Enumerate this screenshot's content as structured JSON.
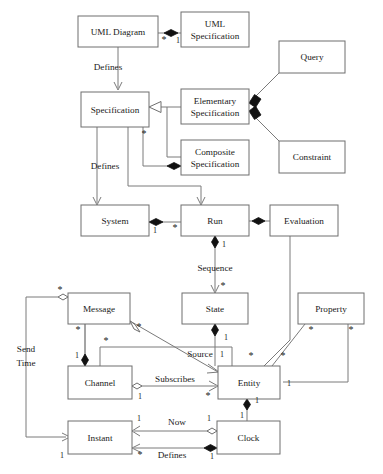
{
  "diagram": {
    "type": "uml-class-diagram",
    "canvas": {
      "width": 383,
      "height": 474,
      "background": "#ffffff"
    },
    "colors": {
      "box_stroke": "#6e6e6e",
      "box_fill": "#ffffff",
      "edge": "#7a7a7a",
      "text": "#1a1a1a",
      "diamond_filled": "#111111"
    },
    "classes": [
      {
        "id": "uml_diagram",
        "label": "UML Diagram",
        "x": 78,
        "y": 16,
        "w": 80,
        "h": 31,
        "lines": [
          "UML Diagram"
        ]
      },
      {
        "id": "uml_specification",
        "label": "UML Specification",
        "x": 181,
        "y": 12,
        "w": 68,
        "h": 35,
        "lines": [
          "UML",
          "Specification"
        ]
      },
      {
        "id": "query",
        "label": "Query",
        "x": 279,
        "y": 41,
        "w": 66,
        "h": 32,
        "lines": [
          "Query"
        ]
      },
      {
        "id": "specification",
        "label": "Specification",
        "x": 81,
        "y": 92,
        "w": 68,
        "h": 35,
        "lines": [
          "Specification"
        ]
      },
      {
        "id": "elementary_specification",
        "label": "Elementary Specification",
        "x": 181,
        "y": 89,
        "w": 68,
        "h": 35,
        "lines": [
          "Elementary",
          "Specification"
        ]
      },
      {
        "id": "constraint",
        "label": "Constraint",
        "x": 279,
        "y": 141,
        "w": 66,
        "h": 32,
        "lines": [
          "Constraint"
        ]
      },
      {
        "id": "composite_specification",
        "label": "Composite Specification",
        "x": 181,
        "y": 140,
        "w": 68,
        "h": 35,
        "lines": [
          "Composite",
          "Specification"
        ]
      },
      {
        "id": "system",
        "label": "System",
        "x": 81,
        "y": 205,
        "w": 68,
        "h": 31,
        "lines": [
          "System"
        ]
      },
      {
        "id": "run",
        "label": "Run",
        "x": 181,
        "y": 205,
        "w": 68,
        "h": 31,
        "lines": [
          "Run"
        ]
      },
      {
        "id": "evaluation",
        "label": "Evaluation",
        "x": 270,
        "y": 205,
        "w": 68,
        "h": 31,
        "lines": [
          "Evaluation"
        ]
      },
      {
        "id": "message",
        "label": "Message",
        "x": 68,
        "y": 293,
        "w": 62,
        "h": 31,
        "lines": [
          "Message"
        ]
      },
      {
        "id": "state",
        "label": "State",
        "x": 182,
        "y": 293,
        "w": 66,
        "h": 31,
        "lines": [
          "State"
        ]
      },
      {
        "id": "property",
        "label": "Property",
        "x": 298,
        "y": 293,
        "w": 66,
        "h": 31,
        "lines": [
          "Property"
        ]
      },
      {
        "id": "channel",
        "label": "Channel",
        "x": 68,
        "y": 366,
        "w": 64,
        "h": 33,
        "lines": [
          "Channel"
        ]
      },
      {
        "id": "entity",
        "label": "Entity",
        "x": 218,
        "y": 366,
        "w": 62,
        "h": 33,
        "lines": [
          "Entity"
        ]
      },
      {
        "id": "instant",
        "label": "Instant",
        "x": 68,
        "y": 421,
        "w": 64,
        "h": 33,
        "lines": [
          "Instant"
        ]
      },
      {
        "id": "clock",
        "label": "Clock",
        "x": 217,
        "y": 421,
        "w": 63,
        "h": 33,
        "lines": [
          "Clock"
        ]
      }
    ],
    "relationships": [
      {
        "id": "umldiagram_umlspec",
        "from": "uml_diagram",
        "to": "uml_specification",
        "kind": "composition",
        "source_mult": "*",
        "target_mult": "1"
      },
      {
        "id": "umldiagram_defines_spec",
        "from": "uml_diagram",
        "to": "specification",
        "kind": "directed",
        "label": "Defines"
      },
      {
        "id": "elem_gen_spec",
        "from": "elementary_specification",
        "to": "specification",
        "kind": "generalization"
      },
      {
        "id": "comp_gen_spec",
        "from": "composite_specification",
        "to": "specification",
        "kind": "generalization"
      },
      {
        "id": "comp_contains_spec",
        "from": "composite_specification",
        "to": "specification",
        "kind": "composition",
        "source_mult": "*"
      },
      {
        "id": "query_elem",
        "from": "query",
        "to": "elementary_specification",
        "kind": "composition"
      },
      {
        "id": "constraint_elem",
        "from": "constraint",
        "to": "elementary_specification",
        "kind": "composition"
      },
      {
        "id": "spec_defines_system",
        "from": "specification",
        "to": "system",
        "kind": "directed",
        "label": "Defines"
      },
      {
        "id": "spec_defines_run",
        "from": "specification",
        "to": "run",
        "kind": "directed"
      },
      {
        "id": "system_run",
        "from": "system",
        "to": "run",
        "kind": "composition",
        "source_mult": "1",
        "target_mult": "*"
      },
      {
        "id": "evaluation_run",
        "from": "evaluation",
        "to": "run",
        "kind": "composition"
      },
      {
        "id": "run_sequence_state",
        "from": "run",
        "to": "state",
        "kind": "composition-directed",
        "label": "Sequence",
        "source_mult": "1",
        "target_mult": "*"
      },
      {
        "id": "message_sendtime_instant",
        "from": "message",
        "to": "instant",
        "kind": "aggregation",
        "label": "Send Time",
        "source_mult": "*",
        "target_mult": "1"
      },
      {
        "id": "message_channel",
        "from": "message",
        "to": "channel",
        "kind": "composition",
        "source_mult": "*",
        "target_mult": "1"
      },
      {
        "id": "message_source_entity",
        "from": "message",
        "to": "entity",
        "kind": "aggregation-directed",
        "label": "Source",
        "source_mult": "*",
        "target_mult": "1"
      },
      {
        "id": "state_entity",
        "from": "state",
        "to": "entity",
        "kind": "composition",
        "target_mult": "1"
      },
      {
        "id": "property_entity_left",
        "from": "property",
        "to": "entity",
        "kind": "association",
        "source_mult": "*",
        "target_mult": "*"
      },
      {
        "id": "property_entity_right",
        "from": "property",
        "to": "entity",
        "kind": "composition",
        "source_mult": "*",
        "target_mult": "1"
      },
      {
        "id": "channel_subscribes_entity",
        "from": "channel",
        "to": "entity",
        "kind": "aggregation-directed",
        "label": "Subscribes",
        "source_mult": "1",
        "target_mult": "*"
      },
      {
        "id": "channel_entity_top",
        "from": "channel",
        "to": "entity",
        "kind": "association",
        "source_mult": "*",
        "target_mult": "*"
      },
      {
        "id": "entity_clock",
        "from": "entity",
        "to": "clock",
        "kind": "composition",
        "source_mult": "1",
        "target_mult": "1"
      },
      {
        "id": "clock_now_instant",
        "from": "clock",
        "to": "instant",
        "kind": "aggregation-directed",
        "label": "Now",
        "source_mult": "1",
        "target_mult": "1"
      },
      {
        "id": "clock_defines_instant",
        "from": "clock",
        "to": "instant",
        "kind": "composition-directed",
        "label": "Defines",
        "source_mult": "1",
        "target_mult": "*"
      }
    ],
    "edge_labels": [
      {
        "id": "lbl_defines_top",
        "text": "Defines",
        "x": 108,
        "y": 70
      },
      {
        "id": "lbl_defines_mid",
        "text": "Defines",
        "x": 105,
        "y": 169
      },
      {
        "id": "lbl_sequence",
        "text": "Sequence",
        "x": 215,
        "y": 271
      },
      {
        "id": "lbl_send",
        "text": "Send",
        "x": 26,
        "y": 352
      },
      {
        "id": "lbl_time",
        "text": "Time",
        "x": 26,
        "y": 366
      },
      {
        "id": "lbl_source",
        "text": "Source",
        "x": 200,
        "y": 357
      },
      {
        "id": "lbl_subscribes",
        "text": "Subscribes",
        "x": 175,
        "y": 382
      },
      {
        "id": "lbl_now",
        "text": "Now",
        "x": 177,
        "y": 425
      },
      {
        "id": "lbl_defines_bottom",
        "text": "Defines",
        "x": 172,
        "y": 458
      }
    ],
    "multiplicities": [
      {
        "id": "m_umldiag_star",
        "text": "*",
        "x": 164,
        "y": 43
      },
      {
        "id": "m_umlspec_1",
        "text": "1",
        "x": 178,
        "y": 43
      },
      {
        "id": "m_spec_star",
        "text": "*",
        "x": 144,
        "y": 137
      },
      {
        "id": "m_system_1",
        "text": "1",
        "x": 155,
        "y": 233
      },
      {
        "id": "m_run_star",
        "text": "*",
        "x": 175,
        "y": 231
      },
      {
        "id": "m_run_seq_1",
        "text": "1",
        "x": 224,
        "y": 247
      },
      {
        "id": "m_state_star",
        "text": "*",
        "x": 223,
        "y": 289
      },
      {
        "id": "m_msg_left_star",
        "text": "*",
        "x": 60,
        "y": 293
      },
      {
        "id": "m_msg_bottom_star",
        "text": "*",
        "x": 78,
        "y": 333
      },
      {
        "id": "m_msg_right_star",
        "text": "*",
        "x": 139,
        "y": 330
      },
      {
        "id": "m_channel_1",
        "text": "1",
        "x": 77,
        "y": 358
      },
      {
        "id": "m_state_entity_1",
        "text": "1",
        "x": 226,
        "y": 340
      },
      {
        "id": "m_source_1",
        "text": "1",
        "x": 222,
        "y": 357
      },
      {
        "id": "m_entity_top_star",
        "text": "*",
        "x": 251,
        "y": 359
      },
      {
        "id": "m_prop_left_star",
        "text": "*",
        "x": 283,
        "y": 359
      },
      {
        "id": "m_prop_l_star",
        "text": "*",
        "x": 311,
        "y": 333
      },
      {
        "id": "m_prop_r_star",
        "text": "*",
        "x": 351,
        "y": 333
      },
      {
        "id": "m_channeltop_star",
        "text": "*",
        "x": 106,
        "y": 344
      },
      {
        "id": "m_entity_sub_star",
        "text": "*",
        "x": 208,
        "y": 399
      },
      {
        "id": "m_channel_sub_1",
        "text": "1",
        "x": 140,
        "y": 399
      },
      {
        "id": "m_entity_right_1",
        "text": "1",
        "x": 289,
        "y": 386
      },
      {
        "id": "m_entity_clock_1",
        "text": "1",
        "x": 257,
        "y": 403
      },
      {
        "id": "m_clock_top_1",
        "text": "1",
        "x": 242,
        "y": 418
      },
      {
        "id": "m_instant_now_1",
        "text": "1",
        "x": 139,
        "y": 421
      },
      {
        "id": "m_clock_now_1",
        "text": "1",
        "x": 209,
        "y": 421
      },
      {
        "id": "m_instant_def_star",
        "text": "*",
        "x": 140,
        "y": 458
      },
      {
        "id": "m_clock_def_1",
        "text": "1",
        "x": 212,
        "y": 459
      },
      {
        "id": "m_instant_left_1",
        "text": "1",
        "x": 62,
        "y": 458
      }
    ]
  }
}
